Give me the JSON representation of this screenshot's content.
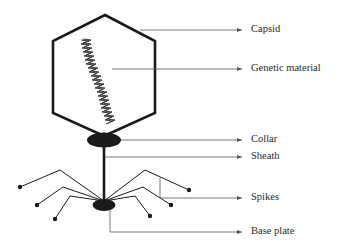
{
  "diagram": {
    "labels": [
      {
        "id": "capsid",
        "text": "Capsid"
      },
      {
        "id": "genetic-material",
        "text": "Genetic material"
      },
      {
        "id": "collar",
        "text": "Collar"
      },
      {
        "id": "sheath",
        "text": "Sheath"
      },
      {
        "id": "spikes",
        "text": "Spikes"
      },
      {
        "id": "base-plate",
        "text": "Base plate"
      }
    ],
    "colors": {
      "stroke": "#1a1a1a",
      "leader": "#555555",
      "text": "#2a2a2a",
      "background": "#ffffff"
    }
  }
}
